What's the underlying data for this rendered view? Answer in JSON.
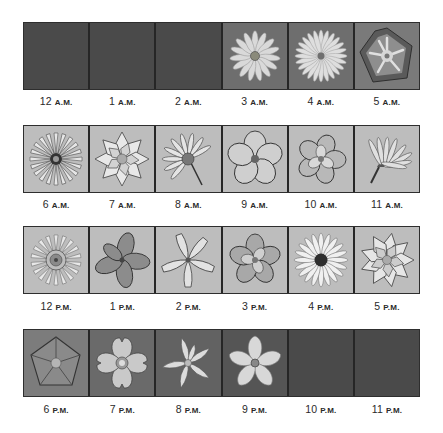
{
  "rows": [
    {
      "cells": [
        {
          "hour": "12",
          "period": "A.M.",
          "state": "closed",
          "flower": "none"
        },
        {
          "hour": "1",
          "period": "A.M.",
          "state": "closed",
          "flower": "none"
        },
        {
          "hour": "2",
          "period": "A.M.",
          "state": "closed",
          "flower": "none"
        },
        {
          "hour": "3",
          "period": "A.M.",
          "state": "open",
          "flower": "daisy-like-icon"
        },
        {
          "hour": "4",
          "period": "A.M.",
          "state": "open",
          "flower": "dandelion-like-icon"
        },
        {
          "hour": "5",
          "period": "A.M.",
          "state": "open",
          "flower": "morning-glory-icon"
        }
      ]
    },
    {
      "cells": [
        {
          "hour": "6",
          "period": "A.M.",
          "state": "open",
          "flower": "dandelion-icon"
        },
        {
          "hour": "7",
          "period": "A.M.",
          "state": "open",
          "flower": "water-lily-icon"
        },
        {
          "hour": "8",
          "period": "A.M.",
          "state": "open",
          "flower": "hawkweed-icon"
        },
        {
          "hour": "9",
          "period": "A.M.",
          "state": "open",
          "flower": "five-petal-icon"
        },
        {
          "hour": "10",
          "period": "A.M.",
          "state": "open",
          "flower": "rose-like-icon"
        },
        {
          "hour": "11",
          "period": "A.M.",
          "state": "open",
          "flower": "side-view-daisy-icon"
        }
      ]
    },
    {
      "cells": [
        {
          "hour": "12",
          "period": "P.M.",
          "state": "open",
          "flower": "dandelion-icon"
        },
        {
          "hour": "1",
          "period": "P.M.",
          "state": "open",
          "flower": "four-petal-icon"
        },
        {
          "hour": "2",
          "period": "P.M.",
          "state": "open",
          "flower": "star-lily-icon"
        },
        {
          "hour": "3",
          "period": "P.M.",
          "state": "open",
          "flower": "rose-like-icon"
        },
        {
          "hour": "4",
          "period": "P.M.",
          "state": "open",
          "flower": "daisy-icon"
        },
        {
          "hour": "5",
          "period": "P.M.",
          "state": "open",
          "flower": "water-lily-icon"
        }
      ]
    },
    {
      "cells": [
        {
          "hour": "6",
          "period": "P.M.",
          "state": "open",
          "flower": "morning-glory-icon"
        },
        {
          "hour": "7",
          "period": "P.M.",
          "state": "open",
          "flower": "primrose-icon"
        },
        {
          "hour": "8",
          "period": "P.M.",
          "state": "open",
          "flower": "lily-icon"
        },
        {
          "hour": "9",
          "period": "P.M.",
          "state": "open",
          "flower": "star-flower-icon"
        },
        {
          "hour": "10",
          "period": "P.M.",
          "state": "closed",
          "flower": "none"
        },
        {
          "hour": "11",
          "period": "P.M.",
          "state": "closed",
          "flower": "none"
        }
      ]
    }
  ]
}
